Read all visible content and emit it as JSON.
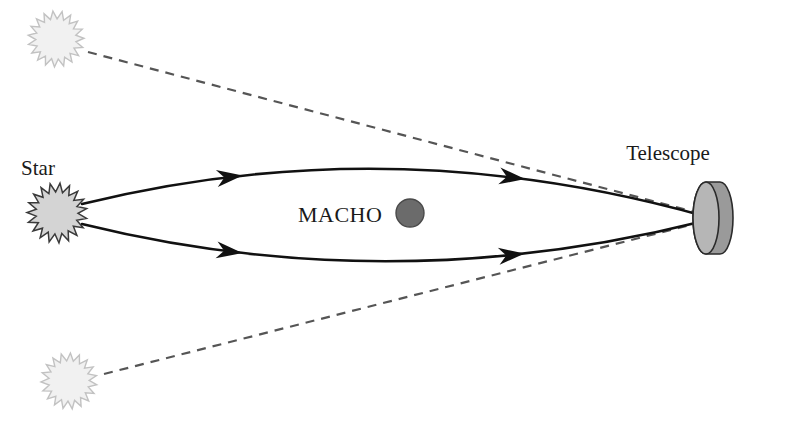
{
  "figure": {
    "kind": "astronomy-diagram",
    "background_color": "#ffffff"
  },
  "labels": {
    "star": "Star",
    "macho": "MACHO",
    "telescope": "Telescope"
  },
  "colors": {
    "source_star_fill": "#d4d4d4",
    "source_star_stroke": "#3a3a3a",
    "apparent_star_fill": "#f1f1f1",
    "apparent_star_stroke": "#c2c2c2",
    "macho_fill": "#6b6b6b",
    "macho_stroke": "#4a4a4a",
    "telescope_face_fill": "#b6b6b6",
    "telescope_body_fill": "#9a9a9a",
    "telescope_stroke": "#2b2b2b",
    "light_path_stroke": "#111111",
    "apparent_path_stroke": "#555555",
    "text": "#1a1a1a"
  },
  "objects": {
    "source_star": {
      "name": "Star",
      "center_x": 57,
      "center_y": 213,
      "radius": 30,
      "points": 19,
      "style": "starburst"
    },
    "apparent_image_upper": {
      "name": "apparent image of star (upper)",
      "center_x": 56,
      "center_y": 39,
      "radius": 28,
      "points": 19,
      "style": "starburst-faint"
    },
    "apparent_image_lower": {
      "name": "apparent image of star (lower)",
      "center_x": 69,
      "center_y": 381,
      "radius": 28,
      "points": 19,
      "style": "starburst-faint"
    },
    "macho": {
      "name": "MACHO",
      "center_x": 410,
      "center_y": 213,
      "radius": 14
    },
    "telescope": {
      "name": "Telescope",
      "center_x": 706,
      "center_y": 218,
      "face_rx": 13,
      "face_ry": 36,
      "depth": 14
    }
  },
  "light_paths": {
    "upper_real": {
      "description": "deflected light ray, star to telescope, bowed upward",
      "start": [
        82,
        204
      ],
      "control": [
        390,
        128
      ],
      "end": [
        704,
        216
      ],
      "arrow_at": [
        236,
        155
      ]
    },
    "lower_real": {
      "description": "deflected light ray, star to telescope, bowed downward",
      "start": [
        82,
        224
      ],
      "control": [
        390,
        300
      ],
      "end": [
        704,
        221
      ],
      "arrow_at": [
        236,
        271
      ]
    },
    "upper_apparent": {
      "description": "dashed line of sight to upper apparent image",
      "start": [
        88,
        52
      ],
      "end": [
        702,
        214
      ]
    },
    "lower_apparent": {
      "description": "dashed line of sight to lower apparent image",
      "start": [
        104,
        374
      ],
      "end": [
        702,
        222
      ]
    }
  },
  "label_positions": {
    "star": [
      38,
      175
    ],
    "macho": [
      298,
      222
    ],
    "telescope": [
      668,
      160
    ]
  }
}
